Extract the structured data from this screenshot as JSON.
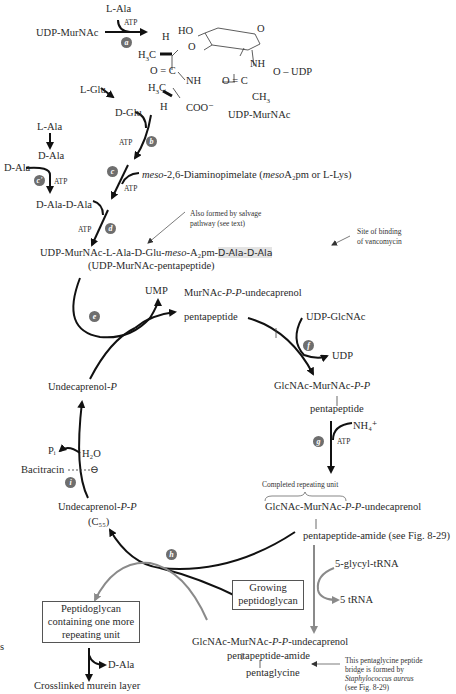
{
  "colors": {
    "arrow_black": "#111111",
    "arrow_gray": "#8a8a8a",
    "badge": "#6e6e6e",
    "highlight": "#e3e3e3"
  },
  "step_badges": {
    "a": "a",
    "b": "b",
    "c": "c",
    "c_prime": "c'",
    "d": "d",
    "e": "e",
    "f": "f",
    "g": "g",
    "h": "h",
    "i": "i"
  },
  "top": {
    "udp_murnac_start": "UDP-MurNAc",
    "l_ala": "L-Ala",
    "atp": "ATP",
    "structure": {
      "ho": "HO",
      "o_ring": "O",
      "h_top": "H",
      "h3c_top": "H3C",
      "o_ether": "O",
      "o_eq_c": "O = C",
      "nh_left": "NH",
      "h3c_bottom": "H3C",
      "h_bottom": "H",
      "coo": "COO⁻",
      "nh_right": "NH",
      "o_udp": "O – UDP",
      "o_eq_c_right": "O = C",
      "ch3": "CH3",
      "label": "UDP-MurNAc"
    }
  },
  "glu_branch": {
    "l_glu": "L-Glu",
    "d_glu": "D-Glu",
    "atp_b": "ATP"
  },
  "dap_branch": {
    "meso_prefix": "meso",
    "text": "-2,6-Diaminopimelate (",
    "meso2": "meso",
    "a2pm": "A₂pm or L-Lys)",
    "atp_c": "ATP"
  },
  "ala_branch": {
    "l_ala": "L-Ala",
    "d_ala_1": "D-Ala",
    "d_ala_2": "D-Ala",
    "atp_c_prime": "ATP",
    "d_ala_d_ala": "D-Ala-D-Ala",
    "atp_d": "ATP"
  },
  "pentapeptide": {
    "line1_a": "UDP-MurNAc-L-Ala-D-Glu-",
    "line1_meso": "meso",
    "line1_b": "-A₂pm-",
    "line1_hl": "D-Ala-D-Ala",
    "line2": "(UDP-MurNAc-pentapeptide)",
    "salvage_note_1": "Also formed by salvage",
    "salvage_note_2": "pathway (see text)",
    "vanco_note_1": "Site of binding",
    "vanco_note_2": "of vancomycin"
  },
  "cycle": {
    "ump": "UMP",
    "lipid1_a": "MurNAc-",
    "lipid1_p": "P-P",
    "lipid1_b": "-undecaprenol",
    "lipid1_bar": "|",
    "lipid1_pep": "pentapeptide",
    "udp_glcnac": "UDP-GlcNAc",
    "udp": "UDP",
    "lipid2_a": "GlcNAc-MurNAc-",
    "lipid2_p": "P-P",
    "lipid2_bar": "|",
    "lipid2_pep": "pentapeptide",
    "nh4": "NH₄⁺",
    "atp_g": "ATP",
    "completed_unit": "Completed repeating unit",
    "lipid3_a": "GlcNAc-MurNAc-",
    "lipid3_p": "P-P",
    "lipid3_b": "-undecaprenol",
    "lipid3_pep": "pentapeptide-amide (see Fig. 8-29)",
    "glycyl_trna": "5-glycyl-tRNA",
    "trna": "5 tRNA",
    "undecaprenol_p_a": "Undecaprenol-",
    "undecaprenol_p_p": "P",
    "pi": "Pᵢ",
    "h2o": "H₂O",
    "bacitracin": "Bacitracin",
    "inhibit": "⊖",
    "undecaprenol_pp_a": "Undecaprenol-",
    "undecaprenol_pp_p": "P-P",
    "c55": "(C₅₅)",
    "growing_1": "Growing",
    "growing_2": "peptidoglycan"
  },
  "bottom": {
    "pg_box_1": "Peptidoglycan",
    "pg_box_2": "containing one more",
    "pg_box_3": "repeating unit",
    "d_ala": "D-Ala",
    "crosslinked": "Crosslinked murein layer",
    "lipid4_a": "GlcNAc-MurNAc-",
    "lipid4_p": "P-P",
    "lipid4_b": "-undecaprenol",
    "lipid4_pep": "pentapeptide-amide",
    "pentaglycine": "pentaglycine",
    "staph_note_1": "This pentaglycine peptide",
    "staph_note_2": "bridge is formed by",
    "staph_note_3": "Staphylococcus aureus",
    "staph_note_4": "(see Fig. 8-29)",
    "edge_s": "s"
  }
}
